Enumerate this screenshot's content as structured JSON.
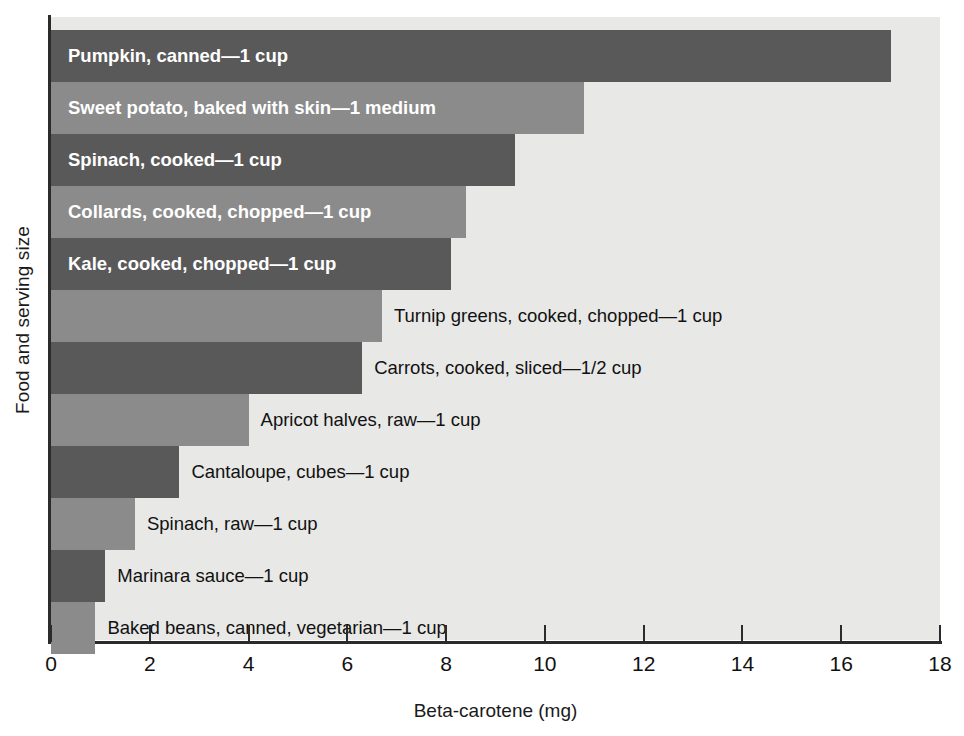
{
  "chart_data": {
    "type": "bar",
    "orientation": "horizontal",
    "title": "",
    "xlabel": "Beta-carotene (mg)",
    "ylabel": "Food and serving size",
    "xlim": [
      0,
      18
    ],
    "xticks": [
      0,
      2,
      4,
      6,
      8,
      10,
      12,
      14,
      16,
      18
    ],
    "grid": false,
    "legend": "none",
    "categories": [
      "Pumpkin, canned—1 cup",
      "Sweet potato, baked with skin—1 medium",
      "Spinach, cooked—1 cup",
      "Collards, cooked, chopped—1 cup",
      "Kale, cooked, chopped—1 cup",
      "Turnip greens, cooked, chopped—1 cup",
      "Carrots, cooked, sliced—1/2 cup",
      "Apricot halves, raw—1 cup",
      "Cantaloupe, cubes—1 cup",
      "Spinach, raw—1 cup",
      "Marinara sauce—1 cup",
      "Baked beans, canned, vegetarian—1 cup"
    ],
    "values": [
      17.0,
      10.8,
      9.4,
      8.4,
      8.1,
      6.7,
      6.3,
      4.0,
      2.6,
      1.7,
      1.1,
      0.9
    ],
    "bars": [
      {
        "label": "Pumpkin, canned—1 cup",
        "value": 17.0,
        "shade": "dark",
        "label_position": "inside"
      },
      {
        "label": "Sweet potato, baked with skin—1 medium",
        "value": 10.8,
        "shade": "light",
        "label_position": "inside"
      },
      {
        "label": "Spinach, cooked—1 cup",
        "value": 9.4,
        "shade": "dark",
        "label_position": "inside"
      },
      {
        "label": "Collards, cooked, chopped—1 cup",
        "value": 8.4,
        "shade": "light",
        "label_position": "inside"
      },
      {
        "label": "Kale, cooked, chopped—1 cup",
        "value": 8.1,
        "shade": "dark",
        "label_position": "inside"
      },
      {
        "label": "Turnip greens, cooked, chopped—1 cup",
        "value": 6.7,
        "shade": "light",
        "label_position": "outside"
      },
      {
        "label": "Carrots, cooked, sliced—1/2 cup",
        "value": 6.3,
        "shade": "dark",
        "label_position": "outside"
      },
      {
        "label": "Apricot halves, raw—1 cup",
        "value": 4.0,
        "shade": "light",
        "label_position": "outside"
      },
      {
        "label": "Cantaloupe, cubes—1 cup",
        "value": 2.6,
        "shade": "dark",
        "label_position": "outside"
      },
      {
        "label": "Spinach, raw—1 cup",
        "value": 1.7,
        "shade": "light",
        "label_position": "outside"
      },
      {
        "label": "Marinara sauce—1 cup",
        "value": 1.1,
        "shade": "dark",
        "label_position": "outside"
      },
      {
        "label": "Baked beans, canned, vegetarian—1 cup",
        "value": 0.9,
        "shade": "light",
        "label_position": "outside"
      }
    ],
    "colors": {
      "bar_dark": "#595959",
      "bar_light": "#8b8b8b",
      "plot_background": "#e8e8e6",
      "axis": "#2b2b2b",
      "text": "#111111",
      "inside_label_text": "#ffffff"
    }
  }
}
